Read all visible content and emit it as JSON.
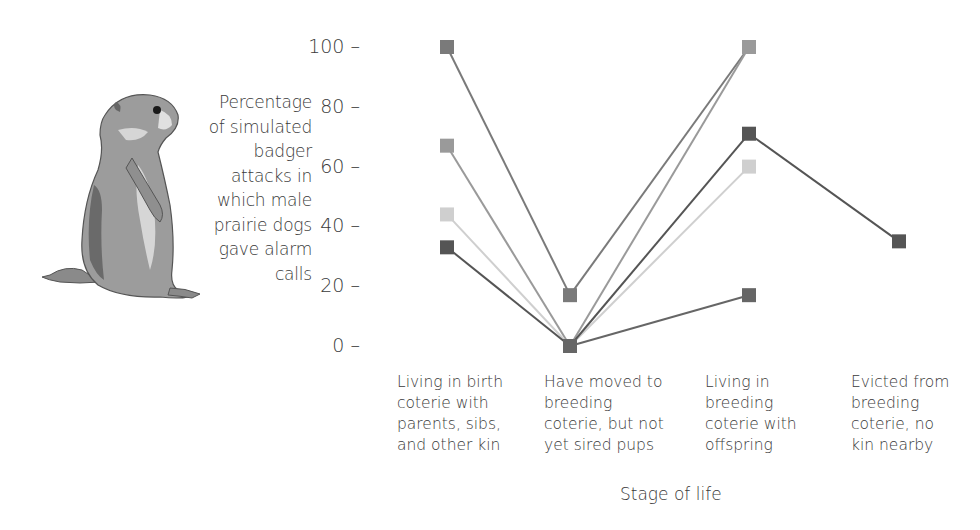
{
  "chart_data": {
    "type": "line",
    "title": "",
    "ylabel": "Percentage of simulated badger attacks in which male prairie dogs gave alarm calls",
    "ylabel_lines": [
      "Percentage",
      "of simulated",
      "badger",
      "attacks in",
      "which male",
      "prairie dogs",
      "gave alarm",
      "calls"
    ],
    "xlabel": "Stage of life",
    "categories": [
      "Living in birth coterie with parents, sibs, and other kin",
      "Have moved to breeding coterie, but not yet sired pups",
      "Living in breeding coterie with offspring",
      "Evicted from breeding coterie, no kin nearby"
    ],
    "category_lines": [
      [
        "Living in birth",
        "coterie with",
        "parents, sibs,",
        "and other kin"
      ],
      [
        "Have moved to",
        "breeding",
        "coterie, but not",
        "yet sired pups"
      ],
      [
        "Living in",
        "breeding",
        "coterie with",
        "offspring"
      ],
      [
        "Evicted from",
        "breeding",
        "coterie, no",
        "kin nearby"
      ]
    ],
    "yticks": [
      0,
      20,
      40,
      60,
      80,
      100
    ],
    "ylim": [
      0,
      100
    ],
    "grid": false,
    "legend": null,
    "series": [
      {
        "name": "Male A",
        "color": "#7a7a7a",
        "values": [
          100,
          17,
          100,
          null
        ]
      },
      {
        "name": "Male B",
        "color": "#9a9a9a",
        "values": [
          67,
          0,
          100,
          null
        ]
      },
      {
        "name": "Male C",
        "color": "#cfcfcf",
        "values": [
          44,
          0,
          60,
          null
        ]
      },
      {
        "name": "Male D",
        "color": "#555555",
        "values": [
          33,
          0,
          71,
          35
        ]
      },
      {
        "name": "Male E",
        "color": "#666666",
        "values": [
          null,
          0,
          17,
          null
        ]
      }
    ]
  },
  "illustration": {
    "icon": "prairie-dog-illustration"
  }
}
